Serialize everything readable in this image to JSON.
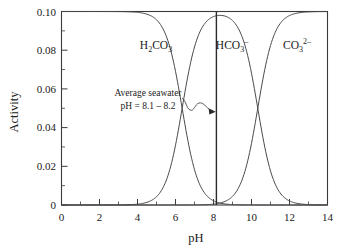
{
  "chart_data": {
    "type": "line",
    "title": "",
    "xlabel": "pH",
    "ylabel": "Activity",
    "xlim": [
      0,
      14
    ],
    "ylim": [
      0,
      0.1
    ],
    "xticks": [
      0,
      2,
      4,
      6,
      8,
      10,
      12,
      14
    ],
    "xtick_labels": [
      "0",
      "2",
      "4",
      "6",
      "8",
      "10",
      "12",
      "14"
    ],
    "xminor_ticks": [
      1,
      3,
      5,
      7,
      9,
      11,
      13
    ],
    "yticks": [
      0,
      0.02,
      0.04,
      0.06,
      0.08,
      0.1
    ],
    "ytick_labels": [
      "0",
      "0.02",
      "0.04",
      "0.06",
      "0.08",
      "0.10"
    ],
    "yminor_ticks": [
      0.01,
      0.03,
      0.05,
      0.07,
      0.09
    ],
    "grid": false,
    "legend": "inline-curve-labels",
    "total_activity": 0.1,
    "pKa1": 6.35,
    "pKa2": 10.33,
    "series": [
      {
        "name": "H2CO3",
        "label_plain": "H2CO3",
        "label_x": 5.0,
        "label_y": 0.0855,
        "description": "Carbonic acid fraction; decreasing sigmoid, half value at pH 6.35",
        "x": [
          0,
          1,
          2,
          3,
          4,
          4.5,
          5,
          5.35,
          5.75,
          6.0,
          6.35,
          6.75,
          7.0,
          7.35,
          7.75,
          8,
          8.5,
          9,
          10,
          11,
          12,
          13,
          14
        ],
        "y": [
          0.1,
          0.1,
          0.1,
          0.0999,
          0.0996,
          0.0986,
          0.0957,
          0.0909,
          0.0799,
          0.0691,
          0.05,
          0.0284,
          0.0183,
          0.0091,
          0.0039,
          0.0022,
          0.0007,
          0.0002,
          0.0,
          0.0,
          0.0,
          0.0,
          0.0
        ]
      },
      {
        "name": "HCO3-",
        "label_plain": "HCO3-",
        "label_x": 8.05,
        "label_y": 0.0855,
        "description": "Bicarbonate fraction; bell shaped, maximum near pH 8.34",
        "x": [
          0,
          1,
          2,
          3,
          4,
          4.5,
          5,
          5.35,
          5.75,
          6.0,
          6.35,
          6.75,
          7.0,
          7.35,
          7.75,
          8,
          8.34,
          9,
          9.5,
          10,
          10.33,
          10.75,
          11,
          11.5,
          12,
          12.5,
          13,
          14
        ],
        "y": [
          0.0,
          0.0,
          0.0,
          0.0001,
          0.0004,
          0.0014,
          0.0043,
          0.0091,
          0.0201,
          0.0309,
          0.05,
          0.0716,
          0.0816,
          0.0906,
          0.0954,
          0.0968,
          0.0977,
          0.0955,
          0.0909,
          0.0812,
          0.05,
          0.0577,
          0.0457,
          0.0204,
          0.0073,
          0.0024,
          0.0008,
          0.0001
        ]
      },
      {
        "name": "CO3 2-",
        "label_plain": "CO3 2-",
        "label_x": 11.85,
        "label_y": 0.0855,
        "description": "Carbonate fraction; increasing sigmoid, half value at pH 10.33",
        "x": [
          0,
          2,
          4,
          6,
          7,
          8,
          8.5,
          9,
          9.33,
          9.75,
          10,
          10.33,
          10.75,
          11,
          11.5,
          12,
          12.5,
          13,
          13.5,
          14
        ],
        "y": [
          0.0,
          0.0,
          0.0,
          0.0,
          0.0,
          0.0004,
          0.0012,
          0.0043,
          0.0091,
          0.0201,
          0.0309,
          0.05,
          0.0716,
          0.0816,
          0.0931,
          0.0976,
          0.0992,
          0.0998,
          0.0999,
          0.1
        ]
      }
    ],
    "annotations": [
      {
        "name": "average-seawater",
        "line1": "Average seawater",
        "line2": "pH = 8.1 – 8.2",
        "text_x": 6.45,
        "text_y": 0.059,
        "marker_ph": 8.15,
        "marker_style": "vertical-line-full-height",
        "arrow_style": "wavy-arrow-pointing-right"
      }
    ]
  },
  "labels": {
    "h2co3": {
      "base": "H",
      "sub1": "2",
      "mid": "CO",
      "sub2": "3"
    },
    "hco3": {
      "base": "HCO",
      "sub": "3",
      "sup": "–"
    },
    "co32": {
      "base": "CO",
      "sub": "3",
      "sup": "2–"
    }
  },
  "axes": {
    "x_title": "pH",
    "y_title": "Activity"
  }
}
